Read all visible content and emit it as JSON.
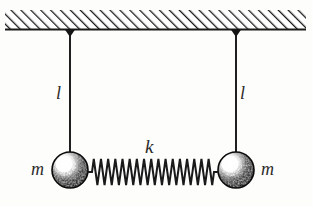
{
  "figure": {
    "kind": "physics-diagram",
    "background_color": "#fdfdfb",
    "ink_color": "#1a1a1a"
  },
  "ceiling": {
    "name": "hatched ceiling support",
    "hatch_direction": "up-right",
    "hatch_color": "#1a1a1a",
    "x_start": 5,
    "x_end": 306,
    "y_top": 10,
    "y_bottom": 30,
    "baseline_thickness": 2
  },
  "pendulums": [
    {
      "id": "left",
      "pivot_x": 70,
      "pivot_y": 30,
      "bob_center_x": 70,
      "bob_center_y": 170,
      "bob_radius": 18,
      "string_length_label": "l",
      "mass_label": "m",
      "bob_fill": "#111111",
      "bob_highlight": "#ffffff"
    },
    {
      "id": "right",
      "pivot_x": 236,
      "pivot_y": 30,
      "bob_center_x": 236,
      "bob_center_y": 170,
      "bob_radius": 18,
      "string_length_label": "l",
      "mass_label": "m",
      "bob_fill": "#111111",
      "bob_highlight": "#ffffff"
    }
  ],
  "spring": {
    "name": "coupling spring",
    "stiffness_label": "k",
    "x_start": 88,
    "x_end": 218,
    "center_y": 172,
    "coil_count": 17,
    "amplitude": 13,
    "color": "#1a1a1a"
  },
  "labels": {
    "length_left": "l",
    "length_right": "l",
    "spring_constant": "k",
    "mass_left": "m",
    "mass_right": "m"
  }
}
